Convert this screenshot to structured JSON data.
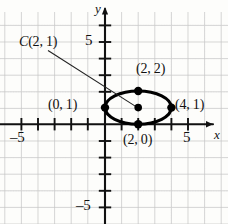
{
  "figure": {
    "type": "coordinate-plane-ellipse-diagram",
    "axes": {
      "x_axis_name": "x",
      "y_axis_name": "y",
      "x_tick_label_negative": "–5",
      "x_tick_label_positive": "5",
      "y_tick_label_positive": "5",
      "y_tick_label_negative": "–5",
      "x_range": [
        -6.3,
        7.1
      ],
      "y_range": [
        -6.0,
        7.5
      ],
      "tick_values_x": [
        -5,
        -4,
        -3,
        -2,
        -1,
        1,
        2,
        3,
        4,
        5
      ],
      "tick_values_y": [
        -5,
        -4,
        -3,
        -2,
        -1,
        1,
        2,
        3,
        4,
        5
      ],
      "grid": true,
      "grid_color": "#c9c9c9",
      "axis_color": "#1a1a1a"
    },
    "curve": {
      "kind": "ellipse",
      "center": [
        2,
        1
      ],
      "semi_axis_x": 2,
      "semi_axis_y": 1,
      "stroke_color": "#000000"
    },
    "points": [
      {
        "name": "top-vertex",
        "coords": [
          2,
          2
        ],
        "label": "(2, 2)"
      },
      {
        "name": "left-vertex",
        "coords": [
          0,
          1
        ],
        "label": "(0, 1)"
      },
      {
        "name": "right-vertex",
        "coords": [
          4,
          1
        ],
        "label": "(4, 1)"
      },
      {
        "name": "bottom-vertex",
        "coords": [
          2,
          0
        ],
        "label": "(2, 0)"
      },
      {
        "name": "center",
        "coords": [
          2,
          1
        ],
        "label": "C(2, 1)"
      }
    ],
    "center_callout": {
      "text_italic": "C",
      "text_rest": "(2, 1)",
      "full": "C(2, 1)",
      "leader_from": [
        -3.4,
        4.45
      ],
      "leader_to": [
        2,
        1
      ]
    }
  }
}
